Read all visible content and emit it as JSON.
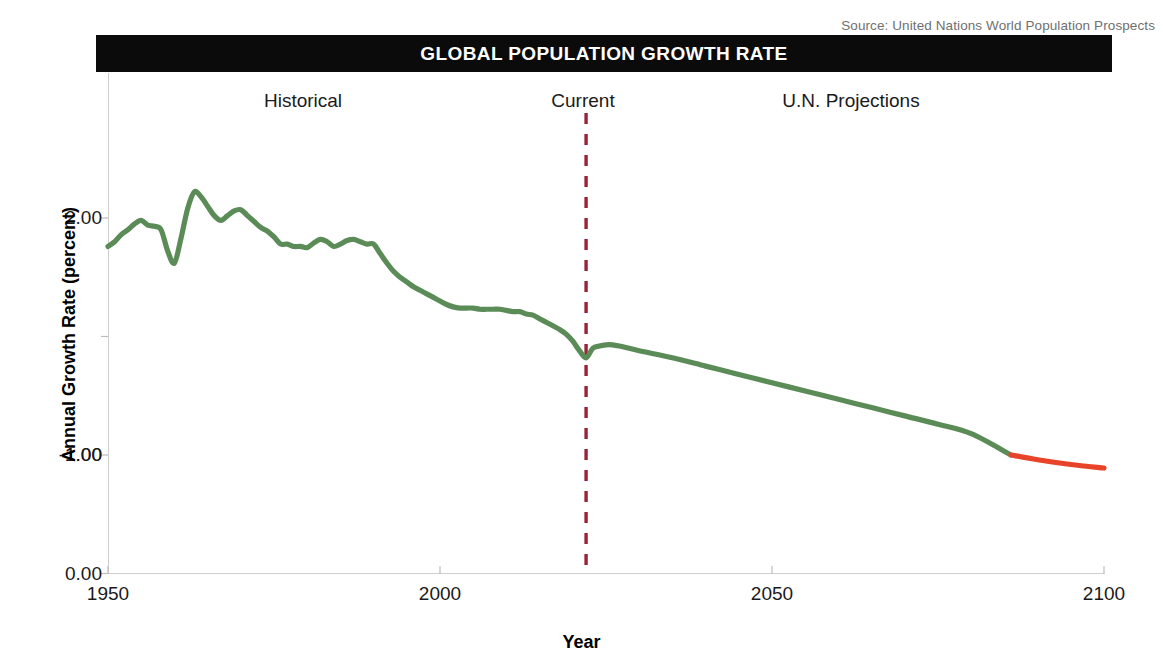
{
  "credit": {
    "text": "Source: United Nations World Population Prospects"
  },
  "banner": {
    "title": "GLOBAL POPULATION GROWTH RATE"
  },
  "axis": {
    "ylabel": "Annual Growth Rate (percent)",
    "xlabel": "Year",
    "yticks": [
      "2.00",
      "1.00",
      "0.00",
      "-1.00"
    ],
    "xticks": [
      "1950",
      "2000",
      "2050",
      "2100"
    ]
  },
  "annotations": {
    "historical": "Historical",
    "current": "Current",
    "projections": "U.N. Projections"
  },
  "colors": {
    "line_positive": "#5b8c58",
    "line_negative": "#e8442a",
    "divider": "#9b2338",
    "banner_bg": "#0b0b0b",
    "banner_text": "#ffffff",
    "frame": "#cfcfcf",
    "text": "#1a1a1a",
    "credit_text": "#6f6f6f"
  },
  "chart_data": {
    "type": "line",
    "title": "GLOBAL POPULATION GROWTH RATE",
    "subtitle": "Source: United Nations World Population Prospects",
    "xlabel": "Year",
    "ylabel": "Annual Growth Rate (percent)",
    "xlim": [
      1950,
      2100
    ],
    "ylim": [
      -1.0,
      2.55
    ],
    "yticks": [
      2.0,
      1.0,
      0.0,
      -1.0
    ],
    "xticks": [
      1950,
      2000,
      2050,
      2100
    ],
    "grid": false,
    "legend": "none",
    "divider_year": 2022,
    "zero_crossing_year": 2086,
    "annotations": [
      {
        "label": "Historical",
        "x": 1987,
        "y": 2.45
      },
      {
        "label": "Current",
        "x": 2022,
        "y": 2.45
      },
      {
        "label": "U.N. Projections",
        "x": 2057,
        "y": 2.45
      }
    ],
    "series": [
      {
        "name": "Annual Growth Rate (percent)",
        "color_positive": "#5b8c58",
        "color_negative": "#e8442a",
        "x": [
          1950,
          1951,
          1952,
          1953,
          1954,
          1955,
          1956,
          1957,
          1958,
          1959,
          1960,
          1961,
          1962,
          1963,
          1964,
          1965,
          1966,
          1967,
          1968,
          1969,
          1970,
          1971,
          1972,
          1973,
          1974,
          1975,
          1976,
          1977,
          1978,
          1979,
          1980,
          1981,
          1982,
          1983,
          1984,
          1985,
          1986,
          1987,
          1988,
          1989,
          1990,
          1991,
          1992,
          1993,
          1994,
          1995,
          1996,
          1997,
          1998,
          1999,
          2000,
          2001,
          2002,
          2003,
          2004,
          2005,
          2006,
          2007,
          2008,
          2009,
          2010,
          2011,
          2012,
          2013,
          2014,
          2015,
          2016,
          2017,
          2018,
          2019,
          2020,
          2021,
          2022,
          2023,
          2024,
          2025,
          2026,
          2027,
          2030,
          2035,
          2040,
          2045,
          2050,
          2055,
          2060,
          2065,
          2070,
          2075,
          2080,
          2086,
          2090,
          2095,
          2100
        ],
        "y": [
          1.76,
          1.8,
          1.86,
          1.9,
          1.95,
          1.98,
          1.94,
          1.93,
          1.9,
          1.72,
          1.62,
          1.83,
          2.08,
          2.22,
          2.18,
          2.1,
          2.02,
          1.98,
          2.02,
          2.06,
          2.07,
          2.02,
          1.97,
          1.92,
          1.89,
          1.84,
          1.78,
          1.78,
          1.76,
          1.76,
          1.75,
          1.79,
          1.82,
          1.8,
          1.76,
          1.78,
          1.81,
          1.82,
          1.8,
          1.78,
          1.78,
          1.7,
          1.62,
          1.55,
          1.5,
          1.46,
          1.42,
          1.39,
          1.36,
          1.33,
          1.3,
          1.27,
          1.25,
          1.24,
          1.24,
          1.24,
          1.23,
          1.23,
          1.23,
          1.23,
          1.22,
          1.21,
          1.21,
          1.19,
          1.18,
          1.15,
          1.12,
          1.09,
          1.06,
          1.02,
          0.96,
          0.88,
          0.82,
          0.9,
          0.92,
          0.93,
          0.93,
          0.92,
          0.88,
          0.82,
          0.75,
          0.68,
          0.61,
          0.54,
          0.47,
          0.4,
          0.33,
          0.26,
          0.18,
          0.0,
          -0.04,
          -0.08,
          -0.11
        ]
      }
    ]
  }
}
